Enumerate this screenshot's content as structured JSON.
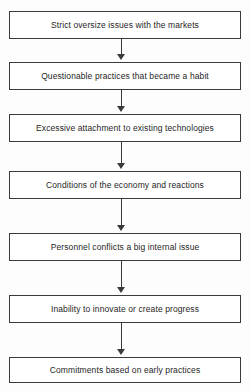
{
  "diagram": {
    "type": "flowchart",
    "orientation": "vertical-top-to-bottom",
    "title": "",
    "colors": {
      "background": "#fdfdfd",
      "box_fill": "#ffffff",
      "box_border": "#3a3a3a",
      "text": "#262626",
      "arrow": "#3a3a3a"
    },
    "nodes": [
      {
        "id": "node-1",
        "label": "Strict oversize issues with the markets"
      },
      {
        "id": "node-2",
        "label": "Questionable practices that became a habit"
      },
      {
        "id": "node-3",
        "label": "Excessive attachment to existing technologies"
      },
      {
        "id": "node-4",
        "label": "Conditions of the economy and reactions"
      },
      {
        "id": "node-5",
        "label": "Personnel conflicts a big internal issue"
      },
      {
        "id": "node-6",
        "label": "Inability to innovate or create progress"
      },
      {
        "id": "node-7",
        "label": "Commitments based on early practices"
      }
    ],
    "connectors": [
      {
        "id": "connector-1",
        "from": "node-1",
        "to": "node-2",
        "arrow": "down"
      },
      {
        "id": "connector-2",
        "from": "node-2",
        "to": "node-3",
        "arrow": "down"
      },
      {
        "id": "connector-3",
        "from": "node-3",
        "to": "node-4",
        "arrow": "down"
      },
      {
        "id": "connector-4",
        "from": "node-4",
        "to": "node-5",
        "arrow": "down"
      },
      {
        "id": "connector-5",
        "from": "node-5",
        "to": "node-6",
        "arrow": "down"
      },
      {
        "id": "connector-6",
        "from": "node-6",
        "to": "node-7",
        "arrow": "down"
      }
    ]
  }
}
